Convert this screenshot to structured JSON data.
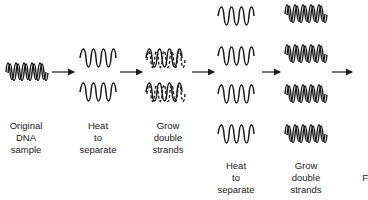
{
  "diagram": {
    "stages": [
      {
        "id": "original",
        "label": [
          "Original",
          "DNA",
          "sample"
        ],
        "strands": 1,
        "type": "double"
      },
      {
        "id": "heat1",
        "label": [
          "Heat",
          "to",
          "separate"
        ],
        "strands": 2,
        "type": "single"
      },
      {
        "id": "grow1",
        "label": [
          "Grow",
          "double",
          "strands"
        ],
        "strands": 2,
        "type": "double-new"
      },
      {
        "id": "heat2",
        "label": [
          "Heat",
          "to",
          "separate"
        ],
        "strands": 4,
        "type": "single"
      },
      {
        "id": "grow2",
        "label": [
          "Grow",
          "double",
          "strands"
        ],
        "strands": 4,
        "type": "double"
      }
    ],
    "arrows": 5,
    "cutoff_label": "F"
  }
}
